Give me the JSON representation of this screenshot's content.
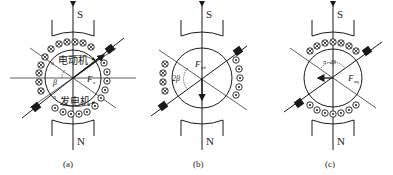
{
  "figure": {
    "panels": [
      {
        "id": "a",
        "caption": "(a)",
        "pole_top": "S",
        "pole_bottom": "N",
        "label_motor": "电动机",
        "label_generator": "发电机",
        "label_n_top": "n",
        "label_n_bottom": "n",
        "label_angle": "β",
        "label_vector": "F",
        "label_vector_sub": "a"
      },
      {
        "id": "b",
        "caption": "(b)",
        "pole_top": "S",
        "pole_bottom": "N",
        "label_angle": "2β",
        "label_vector": "F",
        "label_vector_sub": "ad"
      },
      {
        "id": "c",
        "caption": "(c)",
        "pole_top": "S",
        "pole_bottom": "N",
        "label_angle": "π−2β",
        "label_vector": "F",
        "label_vector_sub": "aq"
      }
    ],
    "colors": {
      "line": "#1a1a1a",
      "background": "#ffffff"
    }
  }
}
